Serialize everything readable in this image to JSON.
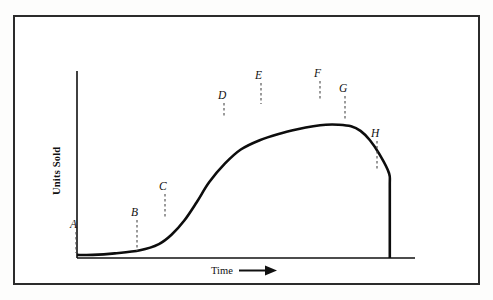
{
  "figure": {
    "name": "product-life-cycle-curve",
    "frame_color": "#2b2b2b",
    "background_color": "#ffffff",
    "curve_color": "#0d0d0d"
  },
  "axes": {
    "y_label": "Units Sold",
    "x_label": "Time",
    "x_arrow_glyph": "⟶"
  },
  "chart_data": {
    "type": "line",
    "title": "",
    "xlabel": "Time",
    "ylabel": "Units Sold",
    "grid": false,
    "legend": false,
    "xlim": [
      0,
      100
    ],
    "ylim": [
      0,
      100
    ],
    "axis_ticks": {
      "x": [],
      "y": []
    },
    "series": [
      {
        "name": "Units Sold over Time",
        "description": "S-shaped product life cycle curve: flat introduction, steep growth, broad plateau at maturity, decline, then abrupt vertical drop to zero at withdrawal.",
        "x": [
          0,
          5,
          12,
          20,
          26,
          30,
          34,
          38,
          42,
          47,
          52,
          58,
          64,
          70,
          75,
          79,
          83,
          87,
          90,
          93,
          96,
          99,
          99.3,
          99.3
        ],
        "y": [
          2,
          2,
          3,
          5,
          9,
          15,
          24,
          36,
          49,
          61,
          70,
          76,
          80,
          83,
          85,
          86,
          86,
          85,
          82,
          76,
          67,
          55,
          45,
          0
        ]
      }
    ],
    "annotations": [
      {
        "label": "A",
        "x": 1,
        "y": 2,
        "label_px": [
          76,
          228
        ],
        "anchor_px": [
          76,
          253
        ],
        "note": "introduction begins"
      },
      {
        "label": "B",
        "x": 20,
        "y": 5,
        "label_px": [
          137,
          216
        ],
        "anchor_px": [
          137,
          251
        ],
        "note": "end of slow introduction"
      },
      {
        "label": "C",
        "x": 29,
        "y": 18,
        "label_px": [
          165,
          190
        ],
        "anchor_px": [
          165,
          219
        ],
        "note": "growth takeoff"
      },
      {
        "label": "D",
        "x": 49,
        "y": 64,
        "label_px": [
          224,
          99
        ],
        "anchor_px": [
          224,
          118
        ],
        "note": "growth slowing"
      },
      {
        "label": "E",
        "x": 61,
        "y": 78,
        "label_px": [
          261,
          79
        ],
        "anchor_px": [
          261,
          104
        ],
        "note": "maturity"
      },
      {
        "label": "F",
        "x": 81,
        "y": 86,
        "label_px": [
          320,
          77
        ],
        "anchor_px": [
          320,
          100
        ],
        "note": "peak sales"
      },
      {
        "label": "G",
        "x": 89,
        "y": 78,
        "label_px": [
          345,
          92
        ],
        "anchor_px": [
          345,
          121
        ],
        "note": "decline begins"
      },
      {
        "label": "H",
        "x": 99,
        "y": 45,
        "label_px": [
          377,
          137
        ],
        "anchor_px": [
          377,
          169
        ],
        "note": "withdrawal / drop-off"
      }
    ]
  }
}
